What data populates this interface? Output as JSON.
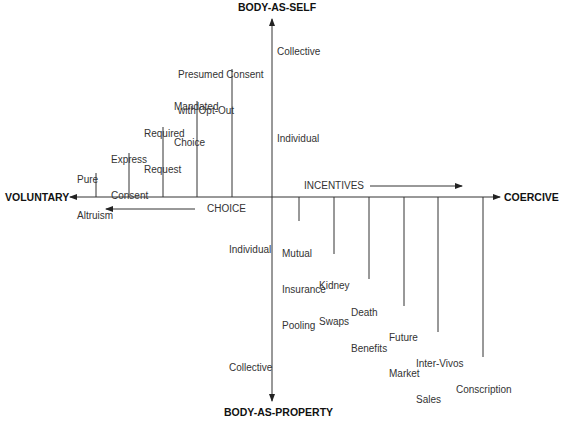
{
  "axes": {
    "top": "BODY-AS-SELF",
    "bottom": "BODY-AS-PROPERTY",
    "left": "VOLUNTARY",
    "right": "COERCIVE"
  },
  "vertical_axis_labels": {
    "upper_collective": "Collective",
    "upper_individual": "Individual",
    "lower_individual": "Individual",
    "lower_collective": "Collective"
  },
  "direction_arrows": {
    "choice": "CHOICE",
    "incentives": "INCENTIVES"
  },
  "choice_items": [
    {
      "line1": "Pure",
      "line2": "Altruism"
    },
    {
      "line1": "Express",
      "line2": "Consent"
    },
    {
      "line1": "Required",
      "line2": "Request"
    },
    {
      "line1": "Mandated",
      "line2": "Choice"
    },
    {
      "line1": "Presumed Consent",
      "line2": "with Opt-Out"
    }
  ],
  "incentive_items": [
    {
      "line1": "Mutual",
      "line2": "Insurance",
      "line3": "Pooling"
    },
    {
      "line1": "Kidney",
      "line2": "Swaps"
    },
    {
      "line1": "Death",
      "line2": "Benefits"
    },
    {
      "line1": "Future",
      "line2": "Market"
    },
    {
      "line1": "Inter-Vivos",
      "line2": "Sales"
    },
    {
      "line1": "Conscription"
    }
  ]
}
